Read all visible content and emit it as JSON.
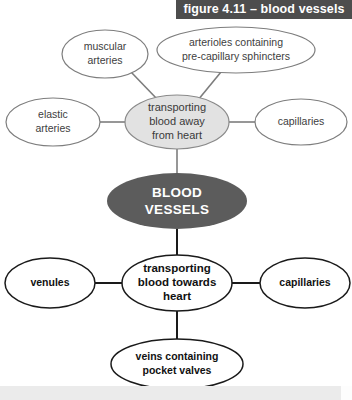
{
  "figure": {
    "banner_label": "figure 4.11 – blood vessels"
  },
  "colors": {
    "banner_background": "#4d4d4d",
    "banner_text": "#ffffff",
    "center_node_fill": "#5c5c5c",
    "center_node_text": "#ffffff",
    "arterial_hub_fill": "#e2e2e2",
    "arterial_stroke": "#7d7d7d",
    "venous_stroke": "#1a1a1a",
    "page_background": "#ffffff",
    "footer_band": "#ebebeb"
  },
  "diagram": {
    "type": "concept-map",
    "center_node": {
      "label_line_1": "BLOOD",
      "label_line_2": "VESSELS"
    },
    "arterial_branch": {
      "hub": {
        "label_line_1": "transporting",
        "label_line_2": "blood away",
        "label_line_3": "from heart"
      },
      "leaves": [
        {
          "id": "muscular-arteries",
          "label_line_1": "muscular",
          "label_line_2": "arteries"
        },
        {
          "id": "arterioles",
          "label_line_1": "arterioles containing",
          "label_line_2": "pre-capillary sphincters"
        },
        {
          "id": "elastic-arteries",
          "label_line_1": "elastic",
          "label_line_2": "arteries"
        },
        {
          "id": "capillaries-upper",
          "label_line_1": "capillaries",
          "label_line_2": ""
        }
      ]
    },
    "venous_branch": {
      "hub": {
        "label_line_1": "transporting",
        "label_line_2": "blood towards",
        "label_line_3": "heart"
      },
      "leaves": [
        {
          "id": "venules",
          "label_line_1": "venules",
          "label_line_2": ""
        },
        {
          "id": "capillaries-lower",
          "label_line_1": "capillaries",
          "label_line_2": ""
        },
        {
          "id": "veins",
          "label_line_1": "veins containing",
          "label_line_2": "pocket valves"
        }
      ]
    }
  }
}
